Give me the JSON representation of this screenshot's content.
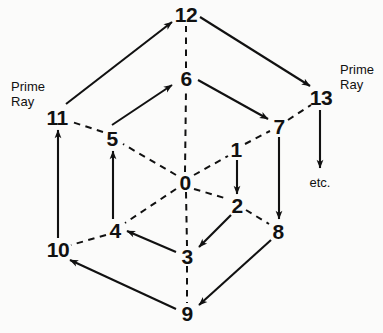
{
  "figure": {
    "type": "diagram",
    "background_color": "#fbfbfa",
    "ink_color": "#111111"
  },
  "nodes": [
    {
      "id": "0",
      "label": "0",
      "x": 185,
      "y": 182
    },
    {
      "id": "1",
      "label": "1",
      "x": 236,
      "y": 149
    },
    {
      "id": "2",
      "label": "2",
      "x": 237,
      "y": 205
    },
    {
      "id": "3",
      "label": "3",
      "x": 187,
      "y": 256
    },
    {
      "id": "4",
      "label": "4",
      "x": 115,
      "y": 230
    },
    {
      "id": "5",
      "label": "5",
      "x": 112,
      "y": 138
    },
    {
      "id": "6",
      "label": "6",
      "x": 186,
      "y": 78
    },
    {
      "id": "7",
      "label": "7",
      "x": 279,
      "y": 126
    },
    {
      "id": "8",
      "label": "8",
      "x": 278,
      "y": 231
    },
    {
      "id": "9",
      "label": "9",
      "x": 187,
      "y": 313
    },
    {
      "id": "10",
      "label": "10",
      "x": 58,
      "y": 249
    },
    {
      "id": "11",
      "label": "11",
      "x": 57,
      "y": 117
    },
    {
      "id": "12",
      "label": "12",
      "x": 186,
      "y": 14
    },
    {
      "id": "13",
      "label": "13",
      "x": 321,
      "y": 97
    }
  ],
  "annotations": [
    {
      "id": "prime-ray-left",
      "text": "Prime\nRay",
      "x": 28,
      "y": 95,
      "align": "left"
    },
    {
      "id": "prime-ray-right",
      "text": "Prime\nRay",
      "x": 357,
      "y": 78,
      "align": "left"
    },
    {
      "id": "etc",
      "text": "etc.",
      "x": 320,
      "y": 183,
      "align": "left"
    }
  ],
  "dashed_edges": [
    {
      "from": "0",
      "to": "1",
      "note": "0 to 1 inner spoke"
    },
    {
      "from": "0",
      "to": "2",
      "note": "0 to 2 inner spoke"
    },
    {
      "from": "0",
      "to": "3",
      "note": "0 to 3 inner spoke"
    },
    {
      "from": "0",
      "to": "4",
      "note": "0 to 4 inner spoke"
    },
    {
      "from": "0",
      "to": "5",
      "note": "0 to 5 inner spoke"
    },
    {
      "from": "0",
      "to": "6",
      "note": "0 to 6 inner spoke"
    },
    {
      "from": "6",
      "to": "12",
      "note": "6 to 12 outer spoke"
    },
    {
      "from": "3",
      "to": "9",
      "note": "3 to 9 outer spoke"
    },
    {
      "from": "1",
      "to": "7",
      "note": "1 to 7 hex side"
    },
    {
      "from": "2",
      "to": "8",
      "note": "2 to 8 hex side"
    },
    {
      "from": "4",
      "to": "10",
      "note": "4 to 10 hex side"
    },
    {
      "from": "5",
      "to": "11",
      "note": "5 to 11 hex side"
    },
    {
      "from": "7",
      "to": "13",
      "note": "7 to 13 hex side"
    }
  ],
  "arrow_edges": [
    {
      "from": "1",
      "to": "2",
      "note": "1 down to 2"
    },
    {
      "from": "2",
      "to": "3",
      "note": "2 down-left to 3"
    },
    {
      "from": "3",
      "to": "4",
      "note": "3 left-up to 4"
    },
    {
      "from": "4",
      "to": "5",
      "note": "4 up to 5"
    },
    {
      "from": "5",
      "to": "6",
      "note": "5 up-right to 6"
    },
    {
      "from": "6",
      "to": "7",
      "note": "6 down-right to 7"
    },
    {
      "from": "7",
      "to": "8",
      "note": "7 down to 8"
    },
    {
      "from": "8",
      "to": "9",
      "note": "8 down-left to 9"
    },
    {
      "from": "9",
      "to": "10",
      "note": "9 up-left to 10"
    },
    {
      "from": "10",
      "to": "11",
      "note": "10 up to 11"
    },
    {
      "from": "11",
      "to": "12",
      "note": "11 up-right to 12"
    },
    {
      "from": "12",
      "to": "13",
      "note": "12 down-right to 13"
    },
    {
      "from": "13",
      "to": "etc",
      "note": "13 down to etc."
    }
  ]
}
